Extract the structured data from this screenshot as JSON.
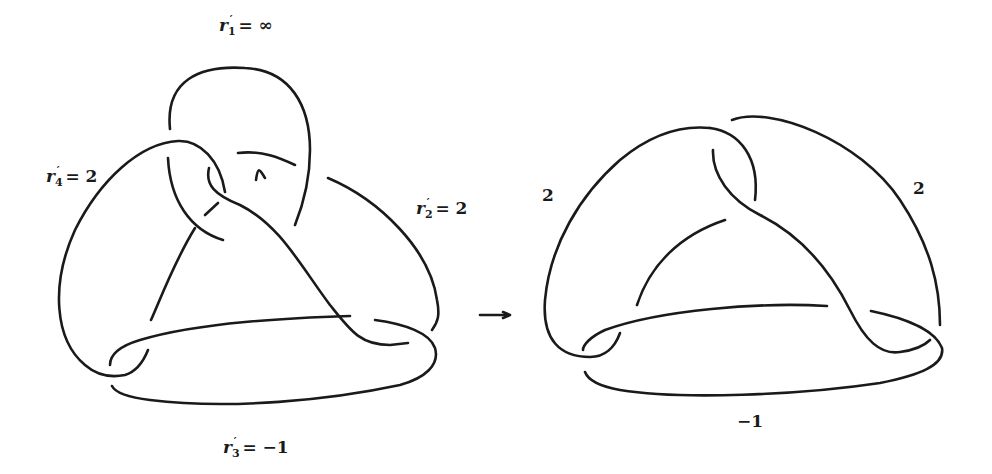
{
  "figure": {
    "left_diagram": {
      "labels": [
        {
          "id": "r1",
          "var": "r",
          "sub": "1",
          "prime": "′",
          "eq": "= ∞"
        },
        {
          "id": "r2",
          "var": "r",
          "sub": "2",
          "prime": "′",
          "eq": "= 2"
        },
        {
          "id": "r3",
          "var": "r",
          "sub": "3",
          "prime": "′",
          "eq": "= −1"
        },
        {
          "id": "r4",
          "var": "r",
          "sub": "4",
          "prime": "′",
          "eq": "= 2"
        }
      ]
    },
    "arrow": "⟶",
    "right_diagram": {
      "labels": [
        {
          "id": "left",
          "text": "2"
        },
        {
          "id": "right",
          "text": "2"
        },
        {
          "id": "bottom",
          "text": "−1"
        }
      ]
    },
    "stroke_color": "#1a1a1a",
    "background": "#ffffff"
  }
}
